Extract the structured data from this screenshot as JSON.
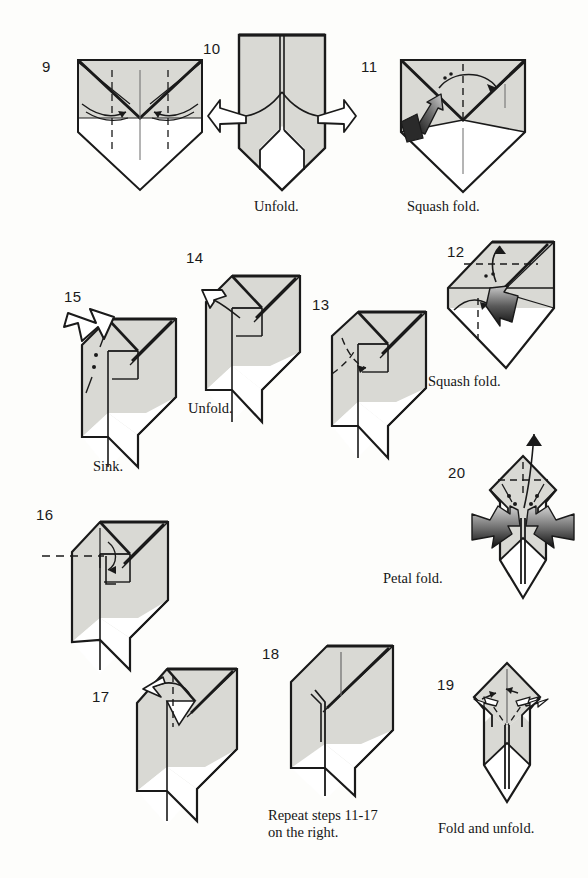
{
  "page": {
    "kind": "origami-instruction-diagram",
    "width": 588,
    "height": 878,
    "background_color": "#fdfdfb",
    "paper_front_color": "#d9d9d4",
    "paper_back_color": "#ffffff",
    "line_color": "#1a1a1a",
    "arrow_dark_color": "#141414",
    "arrow_light_color": "#cfcfcf"
  },
  "steps": [
    {
      "id": "step-9",
      "number": "9",
      "caption": "",
      "num_pos": {
        "x": 42,
        "y": 58
      },
      "fig_pos": {
        "x": 70,
        "y": 40
      },
      "marks": [
        "valley-fold-dashed",
        "fold-arrows-inward"
      ]
    },
    {
      "id": "step-10",
      "number": "10",
      "caption": "Unfold.",
      "num_pos": {
        "x": 203,
        "y": 40
      },
      "caption_pos": {
        "x": 254,
        "y": 198
      },
      "fig_pos": {
        "x": 232,
        "y": 30
      },
      "marks": [
        "unfold-arrows-outward"
      ]
    },
    {
      "id": "step-11",
      "number": "11",
      "caption": "Squash fold.",
      "num_pos": {
        "x": 361,
        "y": 58
      },
      "caption_pos": {
        "x": 407,
        "y": 198
      },
      "fig_pos": {
        "x": 393,
        "y": 42
      },
      "marks": [
        "squash-arrow-dark",
        "valley-fold-dashed",
        "push-arrow"
      ]
    },
    {
      "id": "step-12",
      "number": "12",
      "caption": "Squash fold.",
      "num_pos": {
        "x": 447,
        "y": 243
      },
      "caption_pos": {
        "x": 428,
        "y": 373
      },
      "fig_pos": {
        "x": 430,
        "y": 236
      },
      "marks": [
        "squash-arrow-dark",
        "valley-fold-dashed",
        "rotate-arrows"
      ]
    },
    {
      "id": "step-13",
      "number": "13",
      "caption": "",
      "num_pos": {
        "x": 312,
        "y": 296
      },
      "fig_pos": {
        "x": 326,
        "y": 302
      },
      "marks": [
        "fold-arrow-dashed"
      ]
    },
    {
      "id": "step-14",
      "number": "14",
      "caption": "Unfold.",
      "num_pos": {
        "x": 186,
        "y": 249
      },
      "caption_pos": {
        "x": 188,
        "y": 400
      },
      "fig_pos": {
        "x": 196,
        "y": 262
      },
      "marks": [
        "unfold-arrow-hollow"
      ]
    },
    {
      "id": "step-15",
      "number": "15",
      "caption": "Sink.",
      "num_pos": {
        "x": 64,
        "y": 288
      },
      "caption_pos": {
        "x": 93,
        "y": 458
      },
      "fig_pos": {
        "x": 70,
        "y": 305
      },
      "marks": [
        "push-in-arrow-hollow",
        "sink-crease-dotted"
      ]
    },
    {
      "id": "step-16",
      "number": "16",
      "caption": "",
      "num_pos": {
        "x": 36,
        "y": 506
      },
      "fig_pos": {
        "x": 60,
        "y": 508
      },
      "marks": [
        "x-ray-dashed-line",
        "fold-arrow"
      ]
    },
    {
      "id": "step-17",
      "number": "17",
      "caption": "",
      "num_pos": {
        "x": 92,
        "y": 688
      },
      "fig_pos": {
        "x": 125,
        "y": 653
      },
      "marks": [
        "valley-fold-dashed",
        "fold-arrow-left"
      ]
    },
    {
      "id": "step-18",
      "number": "18",
      "caption": "Repeat steps 11-17\non the right.",
      "num_pos": {
        "x": 262,
        "y": 645
      },
      "caption_pos": {
        "x": 268,
        "y": 807
      },
      "fig_pos": {
        "x": 285,
        "y": 638
      },
      "marks": []
    },
    {
      "id": "step-19",
      "number": "19",
      "caption": "Fold and unfold.",
      "num_pos": {
        "x": 437,
        "y": 676
      },
      "caption_pos": {
        "x": 438,
        "y": 820
      },
      "fig_pos": {
        "x": 462,
        "y": 657
      },
      "marks": [
        "fold-unfold-double-arrows",
        "valley-fold-dashed"
      ]
    },
    {
      "id": "step-20",
      "number": "20",
      "caption": "Petal fold.",
      "num_pos": {
        "x": 448,
        "y": 464
      },
      "caption_pos": {
        "x": 383,
        "y": 570
      },
      "fig_pos": {
        "x": 468,
        "y": 448
      },
      "marks": [
        "petal-arrows-dark",
        "valley-fold-dashed",
        "pull-arrow-up"
      ]
    }
  ]
}
